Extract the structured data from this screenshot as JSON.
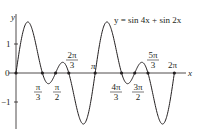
{
  "chart_data": {
    "type": "line",
    "title": "y = sin 4x + sin 2x",
    "xlabel": "x",
    "ylabel": "y",
    "series": [
      {
        "name": "y = sin 4x + sin 2x",
        "function": "sin(4x) + sin(2x)",
        "x_range": [
          0,
          6.2832
        ]
      }
    ],
    "x_ticks": [
      "π/3",
      "π/2",
      "2π/3",
      "π",
      "4π/3",
      "3π/2",
      "5π/3",
      "2π"
    ],
    "x_tick_values": [
      1.0472,
      1.5708,
      2.0944,
      3.1416,
      4.1888,
      4.7124,
      5.236,
      6.2832
    ],
    "y_ticks": [
      "1",
      "-1"
    ],
    "y_tick_values": [
      1,
      -1
    ],
    "origin_label": "0",
    "zeros_marked": [
      0,
      1.0472,
      1.5708,
      2.0944,
      3.1416,
      4.1888,
      4.7124,
      5.236,
      6.2832
    ],
    "xlim": [
      0,
      6.6
    ],
    "ylim": [
      -2,
      2
    ],
    "grid": false,
    "legend": "none"
  },
  "labels": {
    "equation": "y = sin 4x + sin 2x",
    "x_axis": "x",
    "y_axis": "y",
    "origin": "0",
    "y_one": "1",
    "y_minus_one": "−1",
    "pi": "π",
    "pi_over_3_num": "π",
    "pi_over_3_den": "3",
    "pi_over_2_num": "π",
    "pi_over_2_den": "2",
    "two_pi_over_3_num": "2π",
    "two_pi_over_3_den": "3",
    "four_pi_over_3_num": "4π",
    "four_pi_over_3_den": "3",
    "three_pi_over_2_num": "3π",
    "three_pi_over_2_den": "2",
    "five_pi_over_3_num": "5π",
    "five_pi_over_3_den": "3",
    "two_pi": "2π"
  },
  "colors": {
    "curve": "#231f20",
    "axes": "#231f20",
    "background": "#ffffff"
  }
}
